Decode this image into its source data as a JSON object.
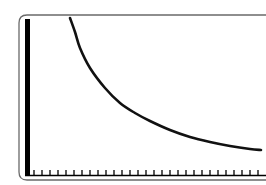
{
  "chart_data": {
    "type": "line",
    "title": "",
    "xlabel": "",
    "ylabel": "",
    "grid": false,
    "legend": null,
    "x_tick_count": 29,
    "x_tick_labels": [],
    "y_tick_labels": [],
    "series": [
      {
        "name": "curve",
        "color": "#111111",
        "points_px": [
          [
            70,
            18
          ],
          [
            75,
            32
          ],
          [
            80,
            48
          ],
          [
            90,
            68
          ],
          [
            105,
            88
          ],
          [
            120,
            103
          ],
          [
            135,
            113
          ],
          [
            150,
            121
          ],
          [
            170,
            130
          ],
          [
            190,
            137
          ],
          [
            210,
            142
          ],
          [
            230,
            146
          ],
          [
            250,
            149
          ],
          [
            261,
            150
          ]
        ]
      }
    ]
  },
  "frame": {
    "border_color": "#555555",
    "axis_color": "#000000"
  }
}
